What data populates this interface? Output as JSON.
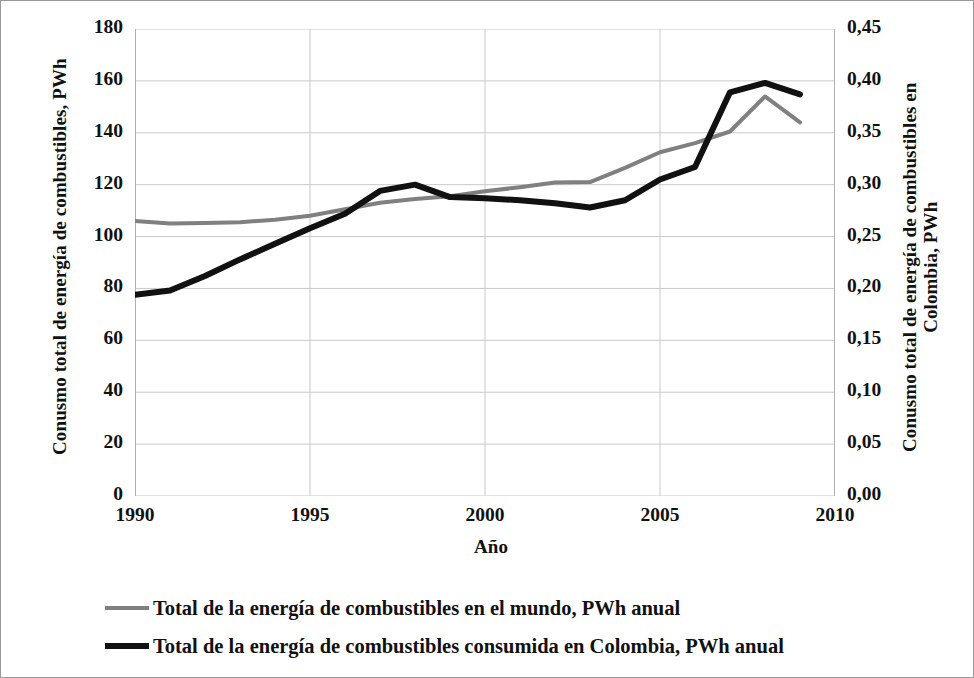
{
  "chart_data": {
    "type": "line",
    "title": "",
    "xlabel": "Año",
    "ylabel": "Conusmo total de energía de combustibles, PWh",
    "y2label": "Conusmo total de energía de combustibles en Colombia, PWh",
    "xlim": [
      1990,
      2010
    ],
    "ylim": [
      0,
      180
    ],
    "y2lim": [
      0,
      0.45
    ],
    "grid": true,
    "legend_position": "bottom",
    "x_tick_labels": [
      "1990",
      "1995",
      "2000",
      "2005",
      "2010"
    ],
    "x_tick_values": [
      1990,
      1995,
      2000,
      2005,
      2010
    ],
    "y_tick_labels": [
      "0",
      "20",
      "40",
      "60",
      "80",
      "100",
      "120",
      "140",
      "160",
      "180"
    ],
    "y_tick_values": [
      0,
      20,
      40,
      60,
      80,
      100,
      120,
      140,
      160,
      180
    ],
    "y2_tick_labels": [
      "0,00",
      "0,05",
      "0,10",
      "0,15",
      "0,20",
      "0,25",
      "0,30",
      "0,35",
      "0,40",
      "0,45"
    ],
    "y2_tick_values": [
      0,
      0.05,
      0.1,
      0.15,
      0.2,
      0.25,
      0.3,
      0.35,
      0.4,
      0.45
    ],
    "x": [
      1990,
      1991,
      1992,
      1993,
      1994,
      1995,
      1996,
      1997,
      1998,
      1999,
      2000,
      2001,
      2002,
      2003,
      2004,
      2005,
      2006,
      2007,
      2008,
      2009
    ],
    "series": [
      {
        "name": "Total de la energía de combustibles en el mundo, PWh anual",
        "axis": "left",
        "color": "#808080",
        "width": 4,
        "values": [
          106.0,
          105.0,
          105.2,
          105.5,
          106.5,
          108.0,
          110.5,
          113.0,
          114.5,
          115.5,
          117.5,
          119.0,
          120.8,
          121.0,
          126.5,
          132.5,
          136.0,
          140.5,
          154.0,
          144.0
        ]
      },
      {
        "name": "Total de la energía de combustibles consumida en Colombia, PWh anual",
        "axis": "right",
        "color": "#111111",
        "width": 6,
        "values": [
          0.194,
          0.198,
          0.212,
          0.228,
          0.243,
          0.258,
          0.272,
          0.294,
          0.3,
          0.288,
          0.287,
          0.285,
          0.282,
          0.278,
          0.285,
          0.305,
          0.317,
          0.389,
          0.398,
          0.387
        ]
      }
    ]
  },
  "axis_titles": {
    "left": "Conusmo total de energía de combustibles, PWh",
    "right_line1": "Conusmo total de energía de combustibles en",
    "right_line2": "Colombia, PWh",
    "x": "Año"
  },
  "legend": {
    "items": [
      {
        "label": "Total de la energía de combustibles en el mundo, PWh anual",
        "style": "world"
      },
      {
        "label": "Total de la energía de combustibles consumida en Colombia, PWh anual",
        "style": "colombia"
      }
    ]
  }
}
